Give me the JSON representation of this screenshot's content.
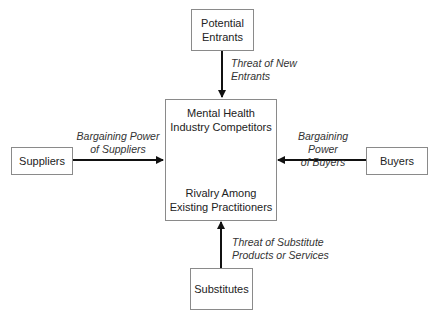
{
  "diagram": {
    "nodes": {
      "top": {
        "line1": "Potential",
        "line2": "Entrants"
      },
      "left": {
        "line1": "Suppliers"
      },
      "right": {
        "line1": "Buyers"
      },
      "bottom": {
        "line1": "Substitutes"
      },
      "center": {
        "top_line1": "Mental Health",
        "top_line2": "Industry Competitors",
        "bottom_line1": "Rivalry Among",
        "bottom_line2": "Existing Practitioners"
      }
    },
    "edges": {
      "top": {
        "line1": "Threat of New",
        "line2": "Entrants"
      },
      "left": {
        "line1": "Bargaining Power",
        "line2": "of Suppliers"
      },
      "right": {
        "line1": "Bargaining Power",
        "line2": "of Buyers"
      },
      "bottom": {
        "line1": "Threat of Substitute",
        "line2": "Products or Services"
      }
    },
    "colors": {
      "line": "#111111",
      "border": "#8a8a8a"
    }
  }
}
